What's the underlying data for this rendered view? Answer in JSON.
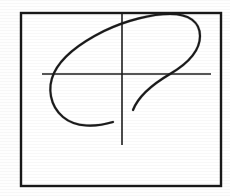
{
  "figure": {
    "title": "Scanned plot: open loop trace with crosshair axes",
    "caption": "",
    "background_color": "#ffffff",
    "ink_color": "#1a1a1a",
    "frame_color": "#181818",
    "axis_color": "#1e1e1e"
  },
  "frame": {
    "name": "plot-border",
    "x": 21,
    "y": 13,
    "width": 200,
    "height": 173,
    "stroke_width": 2.4
  },
  "axes": {
    "horizontal": {
      "label": "",
      "y": 74,
      "x_start": 42,
      "x_end": 211,
      "stroke_width": 1.6
    },
    "vertical": {
      "label": "",
      "x": 122,
      "y_start": 14,
      "y_end": 145,
      "stroke_width": 1.6
    },
    "origin": {
      "x": 122,
      "y": 74
    },
    "tick_labels_x": [],
    "tick_labels_y": []
  },
  "chart_data": {
    "type": "line",
    "title": "",
    "xlabel": "",
    "ylabel": "",
    "grid": false,
    "legend": [],
    "series": [
      {
        "name": "trace",
        "closed": false,
        "description": "open spiral loop resembling a stylized P / Lissajous figure",
        "path": "M 113,122 C 96,127 76,128 63,117 C 50,106 47,88 54,73 C 62,56 82,42 104,31 C 127,20 152,14 170,14 C 189,14 200,22 200,36 C 200,51 187,64 170,74 C 153,84 138,97 133,110"
      }
    ],
    "points": [
      {
        "x": 113,
        "y": 122
      },
      {
        "x": 90,
        "y": 127
      },
      {
        "x": 68,
        "y": 122
      },
      {
        "x": 55,
        "y": 107
      },
      {
        "x": 53,
        "y": 88
      },
      {
        "x": 60,
        "y": 71
      },
      {
        "x": 76,
        "y": 56
      },
      {
        "x": 98,
        "y": 42
      },
      {
        "x": 122,
        "y": 31
      },
      {
        "x": 147,
        "y": 21
      },
      {
        "x": 170,
        "y": 15
      },
      {
        "x": 188,
        "y": 17
      },
      {
        "x": 199,
        "y": 29
      },
      {
        "x": 198,
        "y": 45
      },
      {
        "x": 186,
        "y": 60
      },
      {
        "x": 168,
        "y": 74
      },
      {
        "x": 150,
        "y": 89
      },
      {
        "x": 138,
        "y": 103
      },
      {
        "x": 133,
        "y": 110
      }
    ],
    "xlim": [
      21,
      221
    ],
    "ylim": [
      13,
      186
    ]
  }
}
